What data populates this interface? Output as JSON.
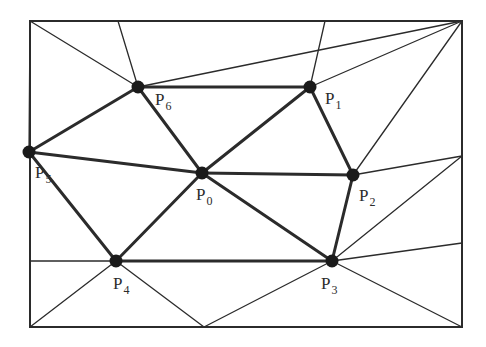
{
  "figure": {
    "kind": "triangulation-mesh",
    "background_color": "#ffffff",
    "line_color": "#2b2b2b",
    "vertex_color": "#1a1a1a",
    "label_color": "#2b2b2b",
    "thin_stroke_width": 1.3,
    "thick_stroke_width": 3.0,
    "border_stroke_width": 2.0,
    "vertex_radius": 6.5
  },
  "border": {
    "name": "outer-rectangle",
    "x": 30,
    "y": 21,
    "width": 432,
    "height": 306,
    "corners": {
      "top_left": [
        30,
        21
      ],
      "top_right": [
        462,
        21
      ],
      "bottom_right": [
        462,
        327
      ],
      "bottom_left": [
        30,
        327
      ]
    }
  },
  "vertices": [
    {
      "id": "P0",
      "label": "P",
      "subscript": "0",
      "x": 202,
      "y": 173,
      "label_x": 196,
      "label_y": 200,
      "marked": true
    },
    {
      "id": "P1",
      "label": "P",
      "subscript": "1",
      "x": 310,
      "y": 87,
      "label_x": 325,
      "label_y": 104,
      "marked": true
    },
    {
      "id": "P2",
      "label": "P",
      "subscript": "2",
      "x": 353,
      "y": 175,
      "label_x": 359,
      "label_y": 201,
      "marked": true
    },
    {
      "id": "P3",
      "label": "P",
      "subscript": "3",
      "x": 332,
      "y": 261,
      "label_x": 321,
      "label_y": 289,
      "marked": true
    },
    {
      "id": "P4",
      "label": "P",
      "subscript": "4",
      "x": 116,
      "y": 261,
      "label_x": 113,
      "label_y": 289,
      "marked": true
    },
    {
      "id": "P5",
      "label": "P",
      "subscript": "5",
      "x": 29,
      "y": 152,
      "label_x": 35,
      "label_y": 178,
      "marked": true
    },
    {
      "id": "P6",
      "label": "P",
      "subscript": "6",
      "x": 138,
      "y": 87,
      "label_x": 155,
      "label_y": 105,
      "marked": true
    }
  ],
  "boundary_points": [
    {
      "id": "T1",
      "x": 118,
      "y": 21,
      "edge": "top"
    },
    {
      "id": "T2",
      "x": 325,
      "y": 21,
      "edge": "top"
    },
    {
      "id": "R1",
      "x": 462,
      "y": 156,
      "edge": "right"
    },
    {
      "id": "R2",
      "x": 462,
      "y": 243,
      "edge": "right"
    },
    {
      "id": "B1",
      "x": 204,
      "y": 327,
      "edge": "bottom"
    },
    {
      "id": "L1",
      "x": 30,
      "y": 261,
      "edge": "left"
    }
  ],
  "edges_thick": [
    {
      "from": [
        138,
        87
      ],
      "to": [
        310,
        87
      ],
      "name": "edge-P6-P1"
    },
    {
      "from": [
        310,
        87
      ],
      "to": [
        353,
        175
      ],
      "name": "edge-P1-P2"
    },
    {
      "from": [
        353,
        175
      ],
      "to": [
        202,
        173
      ],
      "name": "edge-P2-P0"
    },
    {
      "from": [
        202,
        173
      ],
      "to": [
        310,
        87
      ],
      "name": "edge-P0-P1"
    },
    {
      "from": [
        202,
        173
      ],
      "to": [
        138,
        87
      ],
      "name": "edge-P0-P6"
    },
    {
      "from": [
        202,
        173
      ],
      "to": [
        29,
        152
      ],
      "name": "edge-P0-P5"
    },
    {
      "from": [
        29,
        152
      ],
      "to": [
        138,
        87
      ],
      "name": "edge-P5-P6"
    },
    {
      "from": [
        29,
        152
      ],
      "to": [
        116,
        261
      ],
      "name": "edge-P5-P4"
    },
    {
      "from": [
        116,
        261
      ],
      "to": [
        202,
        173
      ],
      "name": "edge-P4-P0"
    },
    {
      "from": [
        116,
        261
      ],
      "to": [
        332,
        261
      ],
      "name": "edge-P4-P3"
    },
    {
      "from": [
        202,
        173
      ],
      "to": [
        332,
        261
      ],
      "name": "edge-P0-P3"
    },
    {
      "from": [
        332,
        261
      ],
      "to": [
        353,
        175
      ],
      "name": "edge-P3-P2"
    }
  ],
  "edges_thin": [
    {
      "from": [
        30,
        21
      ],
      "to": [
        138,
        87
      ],
      "name": "edge-topleft-P6"
    },
    {
      "from": [
        118,
        21
      ],
      "to": [
        138,
        87
      ],
      "name": "edge-top1-P6"
    },
    {
      "from": [
        138,
        87
      ],
      "to": [
        462,
        21
      ],
      "name": "edge-P6-topright"
    },
    {
      "from": [
        325,
        21
      ],
      "to": [
        310,
        87
      ],
      "name": "edge-top2-P1"
    },
    {
      "from": [
        310,
        87
      ],
      "to": [
        462,
        21
      ],
      "name": "edge-P1-topright"
    },
    {
      "from": [
        353,
        175
      ],
      "to": [
        462,
        21
      ],
      "name": "edge-P2-topright"
    },
    {
      "from": [
        353,
        175
      ],
      "to": [
        462,
        156
      ],
      "name": "edge-P2-right1"
    },
    {
      "from": [
        332,
        261
      ],
      "to": [
        462,
        156
      ],
      "name": "edge-P3-right1"
    },
    {
      "from": [
        332,
        261
      ],
      "to": [
        462,
        243
      ],
      "name": "edge-P3-right2"
    },
    {
      "from": [
        332,
        261
      ],
      "to": [
        462,
        327
      ],
      "name": "edge-P3-bottomright"
    },
    {
      "from": [
        332,
        261
      ],
      "to": [
        204,
        327
      ],
      "name": "edge-P3-bottom1"
    },
    {
      "from": [
        116,
        261
      ],
      "to": [
        204,
        327
      ],
      "name": "edge-P4-bottom1"
    },
    {
      "from": [
        116,
        261
      ],
      "to": [
        30,
        327
      ],
      "name": "edge-P4-bottomleft"
    },
    {
      "from": [
        30,
        261
      ],
      "to": [
        116,
        261
      ],
      "name": "edge-left1-P4"
    },
    {
      "from": [
        30,
        21
      ],
      "to": [
        29,
        152
      ],
      "name": "edge-topleft-P5"
    }
  ],
  "legend": {
    "marked_vertex_note": "filled circle marks a mesh vertex"
  }
}
